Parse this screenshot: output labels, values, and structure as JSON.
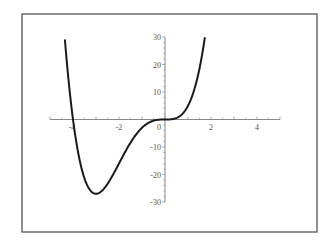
{
  "chart_data": {
    "type": "line",
    "title": "",
    "xlabel": "",
    "ylabel": "",
    "function": "x^4 + 4x^3",
    "xlim": [
      -5,
      5
    ],
    "ylim": [
      -30,
      30
    ],
    "grid": false,
    "legend": null,
    "x_ticks": [
      -2,
      2,
      4
    ],
    "x_tick_labels": [
      "-2",
      "2",
      "4"
    ],
    "x_partial_label": "-4",
    "y_ticks": [
      30,
      20,
      10,
      -10,
      -20,
      -30
    ],
    "y_tick_labels": [
      "30",
      "20",
      "10",
      "-10",
      "-20",
      "-30"
    ],
    "origin_label": "0",
    "series": [
      {
        "name": "f(x)",
        "x": [
          -4.35,
          -4.2,
          -4.0,
          -3.8,
          -3.6,
          -3.4,
          -3.2,
          -3.0,
          -2.8,
          -2.6,
          -2.4,
          -2.2,
          -2.0,
          -1.8,
          -1.6,
          -1.4,
          -1.2,
          -1.0,
          -0.8,
          -0.6,
          -0.4,
          -0.2,
          0.0,
          0.2,
          0.4,
          0.6,
          0.8,
          1.0,
          1.2,
          1.4,
          1.6,
          1.73
        ],
        "values": [
          29.1,
          15.6,
          0.0,
          -11.9,
          -20.2,
          -25.2,
          -26.9,
          -27.0,
          -26.3,
          -24.6,
          -22.1,
          -19.2,
          -16.0,
          -12.8,
          -9.8,
          -7.1,
          -4.8,
          -3.0,
          -1.6,
          -0.7,
          -0.2,
          0.0,
          0.0,
          0.0,
          0.3,
          1.0,
          2.5,
          5.0,
          9.0,
          14.8,
          23.0,
          29.7
        ]
      }
    ],
    "colors": {
      "curve": "#1a1a1a",
      "axes": "#888888",
      "frame": "#555555"
    }
  }
}
